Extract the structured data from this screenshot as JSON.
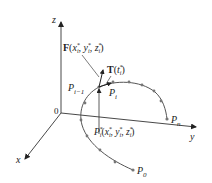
{
  "diagram": {
    "type": "3d-curve-line-integral",
    "axes": {
      "z_label": "z",
      "x_label": "x",
      "y_label": "y",
      "origin_label": "0"
    },
    "labels": {
      "force": {
        "prefix": "F",
        "args": "(x",
        "sub": "i",
        "sup": "*",
        "full": "F(x*_i, y*_i, z*_i)"
      },
      "tangent": {
        "full": "T(t*_i)"
      },
      "p_i_minus_1": "P_{i-1}",
      "p_i": "P_i",
      "p_n": "P_n",
      "p_0": "P_0",
      "p_star": "P*_i(x*_i, y*_i, z*_i)"
    },
    "colors": {
      "axis": "#333333",
      "curve": "#555555",
      "point": "#777777",
      "text": "#222222"
    },
    "curve_point_count": 14
  }
}
